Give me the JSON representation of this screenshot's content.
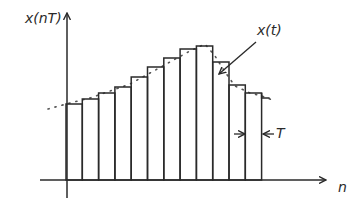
{
  "labels": {
    "y_axis": "x(nT)",
    "x_axis": "n",
    "signal": "x(t)",
    "period": "T"
  },
  "colors": {
    "stroke": "#2a2a2a",
    "dots": "#555555",
    "background": "#ffffff"
  },
  "chart_data": {
    "type": "bar",
    "title": "",
    "xlabel": "n",
    "ylabel": "x(nT)",
    "categories": [
      "1",
      "2",
      "3",
      "4",
      "5",
      "6",
      "7",
      "8",
      "9",
      "10",
      "11",
      "12"
    ],
    "values": [
      76,
      81,
      87,
      93,
      103,
      113,
      122,
      131,
      134,
      118,
      95,
      87
    ],
    "trailing_partial_value": 82,
    "continuous_curve": {
      "name": "x(t)",
      "style": "dotted",
      "points": [
        [
          48,
          109
        ],
        [
          70,
          103
        ],
        [
          90,
          98
        ],
        [
          110,
          91
        ],
        [
          130,
          84
        ],
        [
          150,
          73
        ],
        [
          170,
          62
        ],
        [
          190,
          51
        ],
        [
          205,
          44
        ],
        [
          215,
          56
        ],
        [
          225,
          72
        ],
        [
          235,
          86
        ],
        [
          250,
          93
        ],
        [
          262,
          96
        ],
        [
          275,
          101
        ]
      ]
    },
    "annotations": [
      "x(t) arrow pointing to dotted curve",
      "T spacing marker between two bar edges"
    ],
    "grid": false,
    "legend": "none",
    "bar_width_px": 16.3,
    "baseline_y_px": 180,
    "first_bar_x_px": 66
  }
}
